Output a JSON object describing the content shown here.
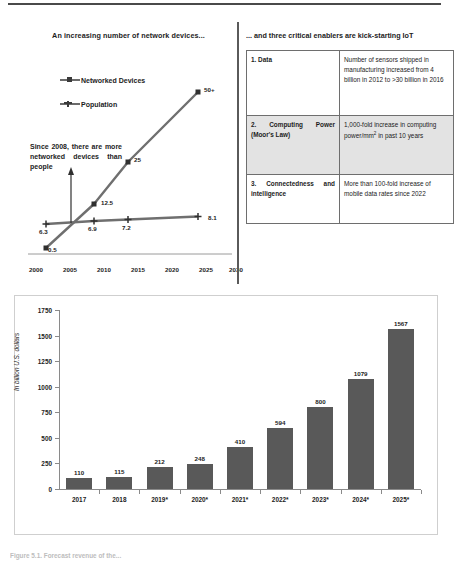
{
  "line_chart": {
    "title": "An increasing number of network devices...",
    "legend": [
      {
        "label": "Networked Devices",
        "marker": "square-marker"
      },
      {
        "label": "Population",
        "marker": "cross-marker"
      }
    ],
    "annotation": "Since 2008, there are more networked devices than people",
    "x_ticks": [
      "2000",
      "2005",
      "2010",
      "2015",
      "2020",
      "2025",
      "2030"
    ]
  },
  "table": {
    "title": "... and three critical enablers are kick-starting IoT",
    "rows": [
      {
        "key": "1. Data",
        "value": "Number of sensors shipped in manufacturing increased from 4 billion in 2012 to >30 billion in 2016"
      },
      {
        "key": "2. Computing Power (Moor's Law)",
        "value_pre": "1,000-fold increase in computing power/mm",
        "value_sup": "2",
        "value_post": " in past 10 years"
      },
      {
        "key": "3. Connectedness and intelligence",
        "value": "More than 100-fold increase of mobile data rates since 2022"
      }
    ]
  },
  "bar_chart": {
    "ylabel": "In billion U.S. dollars"
  },
  "caption": "Figure 5.1. Forecast revenue of the...",
  "chart_data": [
    {
      "type": "line",
      "title": "An increasing number of network devices...",
      "xlabel": "",
      "ylabel": "",
      "xlim": [
        2000,
        2030
      ],
      "ylim": [
        0,
        55
      ],
      "grid": false,
      "legend_position": "upper-left",
      "annotations": [
        "Since 2008, there are more networked devices than people"
      ],
      "series": [
        {
          "name": "Networked Devices",
          "x": [
            2003,
            2010,
            2015,
            2025
          ],
          "values": [
            0.5,
            12.5,
            25,
            50
          ],
          "point_labels": [
            "0.5",
            "12.5",
            "25",
            "50+"
          ]
        },
        {
          "name": "Population",
          "x": [
            2003,
            2010,
            2015,
            2025
          ],
          "values": [
            6.3,
            6.9,
            7.2,
            8.1
          ],
          "point_labels": [
            "6.3",
            "6.9",
            "7.2",
            "8.1"
          ]
        }
      ]
    },
    {
      "type": "bar",
      "title": "",
      "xlabel": "",
      "ylabel": "In billion U.S. dollars",
      "ylim": [
        0,
        1750
      ],
      "yticks": [
        0,
        250,
        500,
        750,
        1000,
        1250,
        1500,
        1750
      ],
      "grid": false,
      "categories": [
        "2017",
        "2018",
        "2019*",
        "2020*",
        "2021*",
        "2022*",
        "2023*",
        "2024*",
        "2025*"
      ],
      "values": [
        110,
        115,
        212,
        248,
        410,
        594,
        800,
        1079,
        1567
      ],
      "value_labels": [
        "110",
        "115",
        "212",
        "248",
        "410",
        "594",
        "800",
        "1079",
        "1567"
      ],
      "bar_color": "#595959"
    }
  ]
}
